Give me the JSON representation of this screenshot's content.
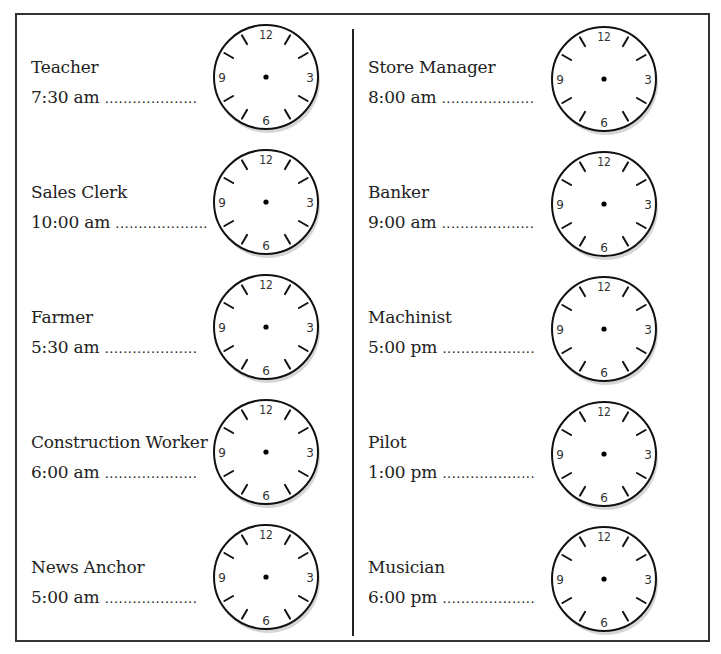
{
  "worksheet": {
    "left_column": [
      {
        "job": "Teacher",
        "time": "7:30 am"
      },
      {
        "job": "Sales Clerk",
        "time": "10:00 am"
      },
      {
        "job": "Farmer",
        "time": "5:30 am"
      },
      {
        "job": "Construction Worker",
        "time": "6:00 am"
      },
      {
        "job": "News Anchor",
        "time": "5:00 am"
      }
    ],
    "right_column": [
      {
        "job": "Store Manager",
        "time": "8:00 am"
      },
      {
        "job": "Banker",
        "time": "9:00 am"
      },
      {
        "job": "Machinist",
        "time": "5:00 pm"
      },
      {
        "job": "Pilot",
        "time": "1:00 pm"
      },
      {
        "job": "Musician",
        "time": "6:00 pm"
      }
    ],
    "dots": "....................",
    "clock_numbers": {
      "n12": "12",
      "n3": "3",
      "n6": "6",
      "n9": "9"
    }
  }
}
